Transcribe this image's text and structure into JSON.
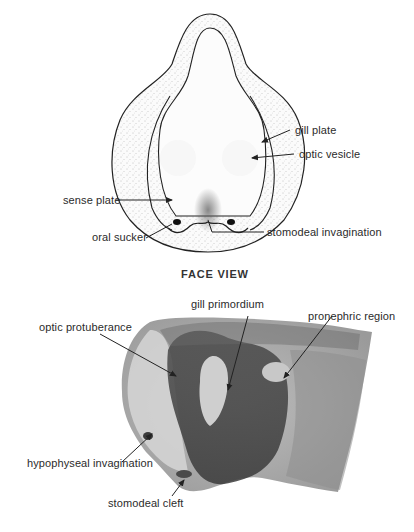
{
  "figure": {
    "face_view": {
      "caption": "FACE VIEW",
      "labels": {
        "gill_plate": "gill plate",
        "optic_vesicle": "optic vesicle",
        "sense_plate": "sense plate",
        "oral_sucker": "oral sucker",
        "stomodeal_invagination": "stomodeal invagination"
      }
    },
    "side_view": {
      "labels": {
        "gill_primordium": "gill primordium",
        "optic_protuberance": "optic protuberance",
        "pronephric_region": "pronephric region",
        "hypophyseal_invagination": "hypophyseal invagination",
        "stomodeal_cleft": "stomodeal cleft"
      }
    }
  }
}
